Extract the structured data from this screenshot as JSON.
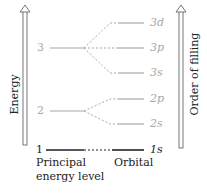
{
  "axes": {
    "left_label": "Energy",
    "right_label": "Order of filling"
  },
  "principal_levels": [
    {
      "n": "1"
    },
    {
      "n": "2"
    },
    {
      "n": "3"
    }
  ],
  "orbitals": {
    "o1s": "1s",
    "o2s": "2s",
    "o2p": "2p",
    "o3s": "3s",
    "o3p": "3p",
    "o3d": "3d"
  },
  "captions": {
    "principal_line1": "Principal",
    "principal_line2": "energy level",
    "orbital": "Orbital"
  },
  "colors": {
    "grey": "#a8a8a8",
    "dark": "#222222"
  }
}
